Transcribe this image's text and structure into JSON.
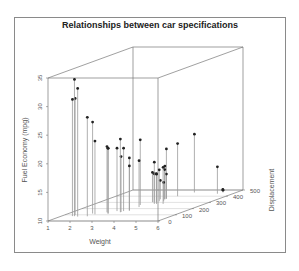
{
  "chart_data": {
    "type": "scatter3d",
    "title": "Relationships between car specifications",
    "xlabel": "Weight",
    "ylabel": "Displacement",
    "zlabel": "Fuel Economy (mpg)",
    "x_ticks": [
      1,
      2,
      3,
      4,
      5,
      6
    ],
    "y_ticks": [
      0,
      100,
      200,
      300,
      400,
      500
    ],
    "z_ticks": [
      10,
      15,
      20,
      25,
      30,
      35
    ],
    "xlim": [
      1,
      6
    ],
    "ylim": [
      0,
      500
    ],
    "zlim": [
      10,
      35
    ],
    "grid": true,
    "type_hint": "h (vertical drop lines to floor)",
    "points": [
      {
        "weight": 1.6,
        "displacement": 78,
        "mpg": 33.9
      },
      {
        "weight": 1.8,
        "displacement": 71,
        "mpg": 32.4
      },
      {
        "weight": 1.5,
        "displacement": 95,
        "mpg": 30.4
      },
      {
        "weight": 1.5,
        "displacement": 79,
        "mpg": 30.4
      },
      {
        "weight": 2.2,
        "displacement": 76,
        "mpg": 27.3
      },
      {
        "weight": 2.1,
        "displacement": 120,
        "mpg": 26.0
      },
      {
        "weight": 2.3,
        "displacement": 108,
        "mpg": 22.8
      },
      {
        "weight": 2.6,
        "displacement": 140,
        "mpg": 21.5
      },
      {
        "weight": 2.8,
        "displacement": 120,
        "mpg": 21.4
      },
      {
        "weight": 3.2,
        "displacement": 141,
        "mpg": 22.8
      },
      {
        "weight": 3.2,
        "displacement": 160,
        "mpg": 21.0
      },
      {
        "weight": 2.9,
        "displacement": 160,
        "mpg": 21.0
      },
      {
        "weight": 3.4,
        "displacement": 168,
        "mpg": 19.2
      },
      {
        "weight": 3.4,
        "displacement": 168,
        "mpg": 17.8
      },
      {
        "weight": 3.2,
        "displacement": 258,
        "mpg": 21.4
      },
      {
        "weight": 3.4,
        "displacement": 225,
        "mpg": 18.1
      },
      {
        "weight": 3.5,
        "displacement": 301,
        "mpg": 15.0
      },
      {
        "weight": 3.6,
        "displacement": 360,
        "mpg": 18.7
      },
      {
        "weight": 3.6,
        "displacement": 350,
        "mpg": 15.2
      },
      {
        "weight": 3.4,
        "displacement": 304,
        "mpg": 15.2
      },
      {
        "weight": 3.6,
        "displacement": 318,
        "mpg": 15.5
      },
      {
        "weight": 3.8,
        "displacement": 400,
        "mpg": 19.2
      },
      {
        "weight": 3.8,
        "displacement": 318,
        "mpg": 13.3
      },
      {
        "weight": 4.1,
        "displacement": 276,
        "mpg": 16.4
      },
      {
        "weight": 3.7,
        "displacement": 276,
        "mpg": 17.3
      },
      {
        "weight": 3.8,
        "displacement": 276,
        "mpg": 15.2
      },
      {
        "weight": 3.6,
        "displacement": 360,
        "mpg": 14.3
      },
      {
        "weight": 3.6,
        "displacement": 351,
        "mpg": 15.8
      },
      {
        "weight": 3.2,
        "displacement": 145,
        "mpg": 19.7
      },
      {
        "weight": 3.6,
        "displacement": 301,
        "mpg": 15.0
      },
      {
        "weight": 2.8,
        "displacement": 121,
        "mpg": 21.4
      },
      {
        "weight": 3.4,
        "displacement": 350,
        "mpg": 13.3
      },
      {
        "weight": 5.3,
        "displacement": 440,
        "mpg": 14.7
      },
      {
        "weight": 5.4,
        "displacement": 460,
        "mpg": 10.4
      },
      {
        "weight": 5.3,
        "displacement": 472,
        "mpg": 10.4
      },
      {
        "weight": 4.1,
        "displacement": 460,
        "mpg": 20.2
      }
    ]
  },
  "projection": {
    "origin_px": [
      48,
      221
    ],
    "x_unit_px": [
      22,
      0
    ],
    "y_unit_px": [
      0.17,
      -0.062
    ],
    "z_unit_px": [
      0,
      -5.72
    ]
  },
  "colors": {
    "frame": "#8a8a8a",
    "box": "#777777",
    "grid": "#cccccc",
    "drop_line": "#9a9a9a",
    "point": "#222222",
    "text": "#555555"
  }
}
